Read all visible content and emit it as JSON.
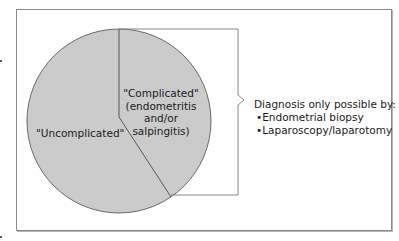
{
  "figure": {
    "segments": [
      {
        "id": "uncomplicated",
        "label": "\"Uncomplicated\"",
        "fill": "#cbcbcb"
      },
      {
        "id": "complicated",
        "label_lines": [
          "\"Complicated\"",
          "(endometritis",
          "and/or salpingitis)"
        ],
        "fill": "#cbcbcb"
      }
    ],
    "callout": {
      "heading": "Diagnosis only possible by:",
      "items": [
        "•Endometrial biopsy",
        "•Laparoscopy/laparotomy"
      ]
    },
    "colors": {
      "pie_fill": "#cbcbcb",
      "pie_stroke": "#4a4a4a",
      "frame_stroke": "#8a8a8a",
      "bracket_stroke": "#7a7a7a"
    }
  }
}
